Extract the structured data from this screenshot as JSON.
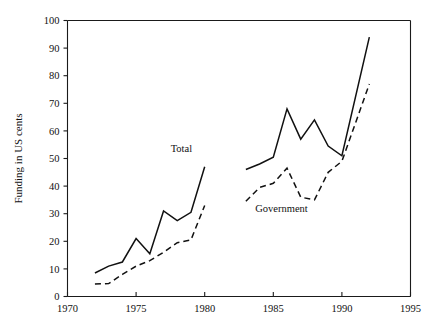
{
  "chart_data": {
    "type": "line",
    "title": "",
    "subtitle": "",
    "xlabel": "",
    "ylabel": "Funding in US cents",
    "xlim": [
      1970,
      1995
    ],
    "ylim": [
      0,
      100
    ],
    "xticks": [
      1970,
      1975,
      1980,
      1985,
      1990,
      1995
    ],
    "xtick_labels": [
      "1970",
      "1975",
      "1980",
      "1985",
      "1990",
      "1995"
    ],
    "yticks": [
      0,
      10,
      20,
      30,
      40,
      50,
      60,
      70,
      80,
      90,
      100
    ],
    "ytick_labels": [
      "0",
      "10",
      "20",
      "30",
      "40",
      "50",
      "60",
      "70",
      "80",
      "90",
      "100"
    ],
    "grid": false,
    "legend_position": "inline-annotation",
    "frame": "left-top-bottom-right-open-box",
    "series": [
      {
        "name": "Total",
        "style": "solid",
        "color": "#111111",
        "annotation": {
          "text": "Total",
          "x": 1978.3,
          "y": 52.5
        },
        "segments": [
          {
            "x": [
              1972,
              1973,
              1974,
              1975,
              1976,
              1977,
              1978,
              1979,
              1980
            ],
            "values": [
              8.5,
              11.0,
              12.5,
              21.0,
              15.5,
              31.0,
              27.5,
              30.5,
              47.0
            ]
          },
          {
            "x": [
              1983,
              1984,
              1985,
              1986,
              1987,
              1988,
              1989,
              1990,
              1992
            ],
            "values": [
              46.0,
              48.0,
              50.5,
              68.0,
              57.0,
              64.0,
              54.5,
              51.0,
              94.0
            ]
          }
        ]
      },
      {
        "name": "Government",
        "style": "dashed",
        "color": "#111111",
        "annotation": {
          "text": "Government",
          "x": 1985.6,
          "y": 30.5
        },
        "segments": [
          {
            "x": [
              1972,
              1973,
              1974,
              1975,
              1976,
              1977,
              1978,
              1979,
              1980
            ],
            "values": [
              4.5,
              4.7,
              8.0,
              11.0,
              13.0,
              16.0,
              19.5,
              20.5,
              33.0
            ]
          },
          {
            "x": [
              1983,
              1984,
              1985,
              1986,
              1987,
              1988,
              1989,
              1990,
              1992
            ],
            "values": [
              34.5,
              39.5,
              41.0,
              46.5,
              36.0,
              35.0,
              45.0,
              49.0,
              77.0
            ]
          }
        ]
      }
    ]
  },
  "annotations": {
    "total_label": "Total",
    "government_label": "Government"
  },
  "axis": {
    "y_title": "Funding in US cents"
  },
  "colors": {
    "ink": "#111111",
    "background": "#ffffff"
  }
}
